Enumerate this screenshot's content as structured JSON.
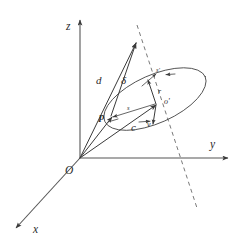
{
  "figure": {
    "type": "vector-diagram",
    "background_color": "#ffffff",
    "line_color": "#3a3a3a",
    "dashed_line_color": "#6a6a6a",
    "axes": {
      "origin_label": "O",
      "z_label": "z",
      "y_label": "y",
      "x_label": "x"
    },
    "labels": {
      "d": "d",
      "delta": "δ",
      "p": "p",
      "c": "c",
      "r": "r",
      "v": "v",
      "s_prime": "s'",
      "o_prime": "o'",
      "s": "s"
    },
    "elements": [
      {
        "name": "z-axis",
        "kind": "axis-arrow"
      },
      {
        "name": "y-axis",
        "kind": "axis-arrow"
      },
      {
        "name": "x-axis",
        "kind": "axis-arrow"
      },
      {
        "name": "orbit-ellipse",
        "kind": "ellipse"
      },
      {
        "name": "orbit-normal-dashed-line",
        "kind": "dashed-line"
      },
      {
        "name": "vector-d",
        "kind": "arrow"
      },
      {
        "name": "vector-delta",
        "kind": "arrow"
      },
      {
        "name": "vector-p",
        "kind": "arrow"
      },
      {
        "name": "vector-c",
        "kind": "arrow"
      },
      {
        "name": "vector-r",
        "kind": "arrow"
      },
      {
        "name": "vector-v",
        "kind": "arrow"
      },
      {
        "name": "vector-s",
        "kind": "arrow"
      },
      {
        "name": "vector-s-prime",
        "kind": "arrow"
      }
    ]
  }
}
